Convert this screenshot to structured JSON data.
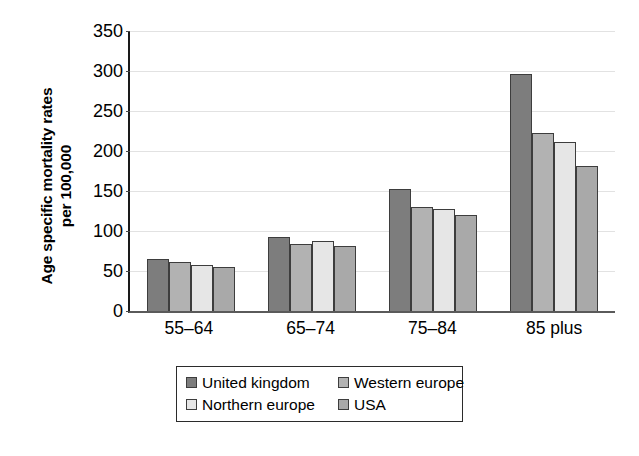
{
  "chart_data": {
    "type": "bar",
    "title": "",
    "subtitle": "",
    "xlabel": "",
    "ylabel": "Age specific mortality rates per 100,000",
    "ylabel_lines": [
      "Age specific mortality rates",
      "per 100,000"
    ],
    "categories": [
      "55–64",
      "65–74",
      "75–84",
      "85 plus"
    ],
    "series": [
      {
        "name": "United kingdom",
        "values": [
          65,
          93,
          153,
          296
        ],
        "color": "#7d7d7d"
      },
      {
        "name": "Western europe",
        "values": [
          61,
          84,
          130,
          223
        ],
        "color": "#b2b2b2"
      },
      {
        "name": "Northern europe",
        "values": [
          58,
          87,
          127,
          211
        ],
        "color": "#e6e6e6"
      },
      {
        "name": "USA",
        "values": [
          55,
          81,
          120,
          181
        ],
        "color": "#a9a9a9"
      }
    ],
    "ylim": [
      0,
      350
    ],
    "ytick_labels": [
      "350",
      "300",
      "250",
      "200",
      "150",
      "100",
      "50",
      "0"
    ],
    "ytick_values": [
      350,
      300,
      250,
      200,
      150,
      100,
      50,
      0
    ],
    "ytick_step": 50,
    "grid": "horizontal",
    "legend_position": "bottom",
    "legend_order": [
      "United kingdom",
      "Western europe",
      "Northern europe",
      "USA"
    ],
    "axis_color": "#1a1a1a",
    "gridline_color": "#e2e2e2",
    "bar_border_color": "#3d3d3d",
    "background_color": "#ffffff"
  }
}
